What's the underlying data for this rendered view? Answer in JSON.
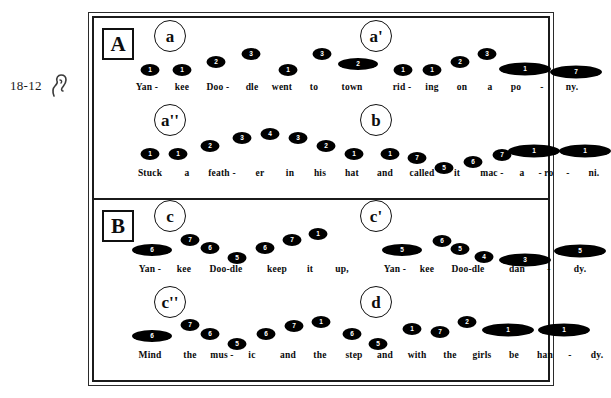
{
  "margin": {
    "number_label": "18-12",
    "icon": "ear-icon"
  },
  "figure": {
    "sections": [
      {
        "letter": "A",
        "lines": [
          {
            "phrases": [
              {
                "label": "a",
                "label_x": 52,
                "lyrics": [
                  {
                    "text": "Yan -",
                    "x": 45
                  },
                  {
                    "text": "kee",
                    "x": 80
                  },
                  {
                    "text": "Doo -",
                    "x": 116
                  },
                  {
                    "text": "dle",
                    "x": 150
                  },
                  {
                    "text": "went",
                    "x": 180
                  },
                  {
                    "text": "to",
                    "x": 212
                  },
                  {
                    "text": "town",
                    "x": 250
                  }
                ],
                "notes": [
                  {
                    "degree": "1",
                    "x": 48,
                    "y": 46,
                    "size": "short"
                  },
                  {
                    "degree": "1",
                    "x": 80,
                    "y": 46,
                    "size": "short"
                  },
                  {
                    "degree": "2",
                    "x": 114,
                    "y": 38,
                    "size": "short"
                  },
                  {
                    "degree": "3",
                    "x": 149,
                    "y": 30,
                    "size": "short"
                  },
                  {
                    "degree": "1",
                    "x": 186,
                    "y": 46,
                    "size": "short"
                  },
                  {
                    "degree": "3",
                    "x": 220,
                    "y": 30,
                    "size": "short"
                  },
                  {
                    "degree": "2",
                    "x": 256,
                    "y": 40,
                    "size": "med"
                  }
                ]
              },
              {
                "label": "a'",
                "label_x": 258,
                "lyrics": [
                  {
                    "text": "rid -",
                    "x": 300
                  },
                  {
                    "text": "ing",
                    "x": 330
                  },
                  {
                    "text": "on",
                    "x": 360
                  },
                  {
                    "text": "a",
                    "x": 388
                  },
                  {
                    "text": "po",
                    "x": 414
                  },
                  {
                    "text": "-",
                    "x": 440
                  },
                  {
                    "text": "ny.",
                    "x": 470
                  }
                ],
                "notes": [
                  {
                    "degree": "1",
                    "x": 301,
                    "y": 46,
                    "size": "short"
                  },
                  {
                    "degree": "1",
                    "x": 330,
                    "y": 46,
                    "size": "short"
                  },
                  {
                    "degree": "2",
                    "x": 358,
                    "y": 38,
                    "size": "short"
                  },
                  {
                    "degree": "3",
                    "x": 385,
                    "y": 30,
                    "size": "short"
                  },
                  {
                    "degree": "1",
                    "x": 423,
                    "y": 45,
                    "size": "long"
                  },
                  {
                    "degree": "7",
                    "x": 474,
                    "y": 48,
                    "size": "long"
                  }
                ]
              }
            ]
          },
          {
            "phrases": [
              {
                "label": "a''",
                "label_x": 52,
                "lyrics": [
                  {
                    "text": "Stuck",
                    "x": 48
                  },
                  {
                    "text": "a",
                    "x": 85
                  },
                  {
                    "text": "feath -",
                    "x": 120
                  },
                  {
                    "text": "er",
                    "x": 158
                  },
                  {
                    "text": "in",
                    "x": 188
                  },
                  {
                    "text": "his",
                    "x": 218
                  },
                  {
                    "text": "hat",
                    "x": 250
                  },
                  {
                    "text": "and",
                    "x": 283
                  },
                  {
                    "text": "called",
                    "x": 320
                  },
                  {
                    "text": "it",
                    "x": 355
                  },
                  {
                    "text": "mac -",
                    "x": 390
                  },
                  {
                    "text": "a",
                    "x": 420
                  },
                  {
                    "text": "- ro",
                    "x": 444
                  },
                  {
                    "text": "-",
                    "x": 466
                  },
                  {
                    "text": "ni.",
                    "x": 492
                  }
                ],
                "notes": [
                  {
                    "degree": "1",
                    "x": 48,
                    "y": 44,
                    "size": "short"
                  },
                  {
                    "degree": "1",
                    "x": 76,
                    "y": 44,
                    "size": "short"
                  },
                  {
                    "degree": "2",
                    "x": 108,
                    "y": 36,
                    "size": "short"
                  },
                  {
                    "degree": "3",
                    "x": 140,
                    "y": 28,
                    "size": "short"
                  },
                  {
                    "degree": "4",
                    "x": 168,
                    "y": 24,
                    "size": "short"
                  },
                  {
                    "degree": "3",
                    "x": 196,
                    "y": 28,
                    "size": "short"
                  },
                  {
                    "degree": "2",
                    "x": 224,
                    "y": 36,
                    "size": "short"
                  },
                  {
                    "degree": "1",
                    "x": 252,
                    "y": 44,
                    "size": "short"
                  }
                ]
              },
              {
                "label": "b",
                "label_x": 258,
                "lyrics": [],
                "notes": [
                  {
                    "degree": "1",
                    "x": 288,
                    "y": 44,
                    "size": "short"
                  },
                  {
                    "degree": "7",
                    "x": 315,
                    "y": 48,
                    "size": "short"
                  },
                  {
                    "degree": "5",
                    "x": 342,
                    "y": 58,
                    "size": "short"
                  },
                  {
                    "degree": "6",
                    "x": 371,
                    "y": 52,
                    "size": "short"
                  },
                  {
                    "degree": "7",
                    "x": 400,
                    "y": 45,
                    "size": "short"
                  },
                  {
                    "degree": "1",
                    "x": 432,
                    "y": 41,
                    "size": "long"
                  },
                  {
                    "degree": "1",
                    "x": 483,
                    "y": 41,
                    "size": "long"
                  }
                ]
              }
            ]
          }
        ]
      },
      {
        "letter": "B",
        "lines": [
          {
            "phrases": [
              {
                "label": "c",
                "label_x": 52,
                "lyrics": [
                  {
                    "text": "Yan -",
                    "x": 48
                  },
                  {
                    "text": "kee",
                    "x": 82
                  },
                  {
                    "text": "Doo-dle",
                    "x": 124
                  },
                  {
                    "text": "keep",
                    "x": 175
                  },
                  {
                    "text": "it",
                    "x": 208
                  },
                  {
                    "text": "up,",
                    "x": 240
                  }
                ],
                "notes": [
                  {
                    "degree": "6",
                    "x": 50,
                    "y": 44,
                    "size": "med"
                  },
                  {
                    "degree": "7",
                    "x": 88,
                    "y": 34,
                    "size": "short"
                  },
                  {
                    "degree": "6",
                    "x": 108,
                    "y": 42,
                    "size": "short"
                  },
                  {
                    "degree": "5",
                    "x": 135,
                    "y": 52,
                    "size": "short"
                  },
                  {
                    "degree": "6",
                    "x": 163,
                    "y": 42,
                    "size": "short"
                  },
                  {
                    "degree": "7",
                    "x": 190,
                    "y": 34,
                    "size": "short"
                  },
                  {
                    "degree": "1",
                    "x": 216,
                    "y": 28,
                    "size": "short"
                  }
                ]
              },
              {
                "label": "c'",
                "label_x": 258,
                "lyrics": [
                  {
                    "text": "Yan -",
                    "x": 293
                  },
                  {
                    "text": "kee",
                    "x": 325
                  },
                  {
                    "text": "Doo-dle",
                    "x": 366
                  },
                  {
                    "text": "dan",
                    "x": 415
                  },
                  {
                    "text": "-",
                    "x": 447
                  },
                  {
                    "text": "dy.",
                    "x": 478
                  }
                ],
                "notes": [
                  {
                    "degree": "5",
                    "x": 300,
                    "y": 44,
                    "size": "med"
                  },
                  {
                    "degree": "6",
                    "x": 340,
                    "y": 35,
                    "size": "short"
                  },
                  {
                    "degree": "5",
                    "x": 358,
                    "y": 43,
                    "size": "short"
                  },
                  {
                    "degree": "4",
                    "x": 382,
                    "y": 51,
                    "size": "short"
                  },
                  {
                    "degree": "3",
                    "x": 423,
                    "y": 54,
                    "size": "long"
                  },
                  {
                    "degree": "5",
                    "x": 478,
                    "y": 45,
                    "size": "long"
                  }
                ]
              }
            ]
          },
          {
            "phrases": [
              {
                "label": "c''",
                "label_x": 52,
                "lyrics": [
                  {
                    "text": "Mind",
                    "x": 48
                  },
                  {
                    "text": "the",
                    "x": 88
                  },
                  {
                    "text": "mus -",
                    "x": 120
                  },
                  {
                    "text": "ic",
                    "x": 150
                  },
                  {
                    "text": "and",
                    "x": 186
                  },
                  {
                    "text": "the",
                    "x": 218
                  },
                  {
                    "text": "step",
                    "x": 252
                  },
                  {
                    "text": "and",
                    "x": 283
                  },
                  {
                    "text": "with",
                    "x": 315
                  },
                  {
                    "text": "the",
                    "x": 348
                  },
                  {
                    "text": "girls",
                    "x": 380
                  },
                  {
                    "text": "be",
                    "x": 412
                  },
                  {
                    "text": "han",
                    "x": 443
                  },
                  {
                    "text": "-",
                    "x": 468
                  },
                  {
                    "text": "dy.",
                    "x": 495
                  }
                ],
                "notes": [
                  {
                    "degree": "6",
                    "x": 50,
                    "y": 44,
                    "size": "med"
                  },
                  {
                    "degree": "7",
                    "x": 88,
                    "y": 33,
                    "size": "short"
                  },
                  {
                    "degree": "6",
                    "x": 108,
                    "y": 42,
                    "size": "short"
                  },
                  {
                    "degree": "5",
                    "x": 135,
                    "y": 52,
                    "size": "short"
                  },
                  {
                    "degree": "6",
                    "x": 164,
                    "y": 42,
                    "size": "short"
                  },
                  {
                    "degree": "7",
                    "x": 192,
                    "y": 34,
                    "size": "short"
                  },
                  {
                    "degree": "1",
                    "x": 219,
                    "y": 30,
                    "size": "short"
                  },
                  {
                    "degree": "6",
                    "x": 250,
                    "y": 42,
                    "size": "short"
                  },
                  {
                    "degree": "5",
                    "x": 276,
                    "y": 52,
                    "size": "short"
                  }
                ]
              },
              {
                "label": "d",
                "label_x": 258,
                "lyrics": [],
                "notes": [
                  {
                    "degree": "1",
                    "x": 310,
                    "y": 37,
                    "size": "short"
                  },
                  {
                    "degree": "7",
                    "x": 338,
                    "y": 40,
                    "size": "short"
                  },
                  {
                    "degree": "2",
                    "x": 365,
                    "y": 30,
                    "size": "short"
                  },
                  {
                    "degree": "1",
                    "x": 406,
                    "y": 38,
                    "size": "long"
                  },
                  {
                    "degree": "1",
                    "x": 462,
                    "y": 38,
                    "size": "long"
                  }
                ]
              }
            ]
          }
        ]
      }
    ]
  },
  "chart_data": {
    "type": "diagram",
    "notation": "Filled ovals contain scale-degree numbers; vertical position encodes pitch height; wider ovals encode longer note durations.",
    "sections": [
      {
        "letter": "A",
        "phrases": [
          {
            "label": "a",
            "degrees": [
              1,
              1,
              2,
              3,
              1,
              3,
              2
            ],
            "lyrics": "Yan - kee Doo - dle went to town"
          },
          {
            "label": "a'",
            "degrees": [
              1,
              1,
              2,
              3,
              1,
              7
            ],
            "lyrics": "rid - ing on a po - ny."
          },
          {
            "label": "a''",
            "degrees": [
              1,
              1,
              2,
              3,
              4,
              3,
              2,
              1
            ],
            "lyrics": "Stuck a feath - er in his hat and"
          },
          {
            "label": "b",
            "degrees": [
              1,
              7,
              5,
              6,
              7,
              1,
              1
            ],
            "lyrics": "called it mac - a - ro - ni."
          }
        ]
      },
      {
        "letter": "B",
        "phrases": [
          {
            "label": "c",
            "degrees": [
              6,
              7,
              6,
              5,
              6,
              7,
              1
            ],
            "lyrics": "Yan - kee Doo-dle keep it up,"
          },
          {
            "label": "c'",
            "degrees": [
              5,
              6,
              5,
              4,
              3,
              5
            ],
            "lyrics": "Yan - kee Doo-dle dan - dy."
          },
          {
            "label": "c''",
            "degrees": [
              6,
              7,
              6,
              5,
              6,
              7,
              1,
              6,
              5
            ],
            "lyrics": "Mind the mus - ic and the step and"
          },
          {
            "label": "d",
            "degrees": [
              1,
              7,
              2,
              1,
              1
            ],
            "lyrics": "with the girls be han - dy."
          }
        ]
      }
    ]
  }
}
